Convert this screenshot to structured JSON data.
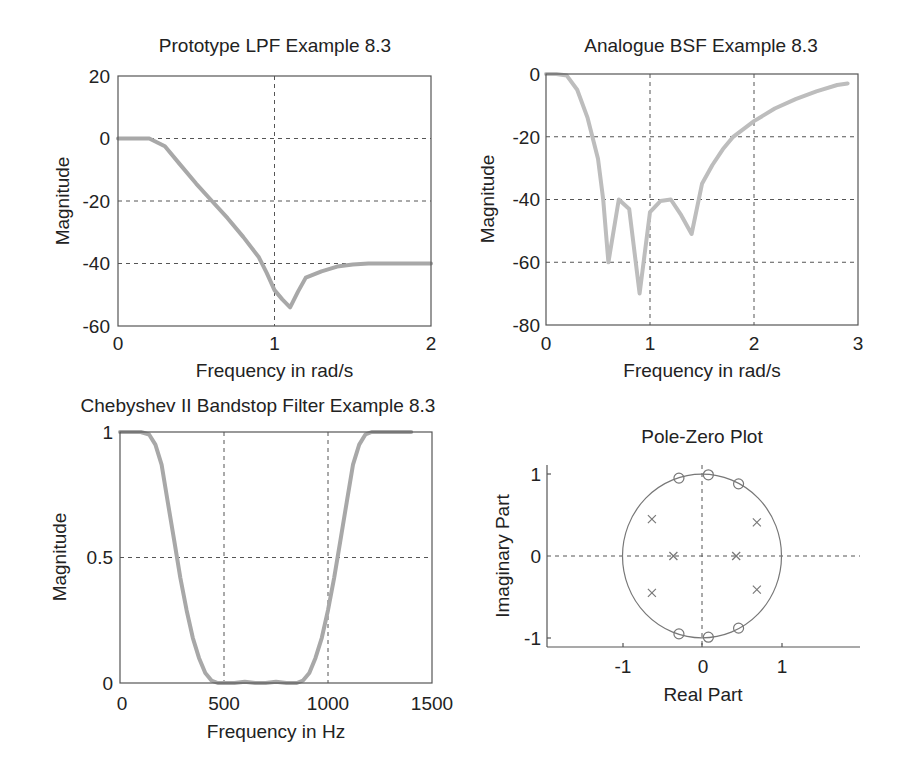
{
  "chart_data": [
    {
      "id": "lpf",
      "type": "line",
      "title": "Prototype LPF Example 8.3",
      "xlabel": "Frequency in rad/s",
      "ylabel": "Magnitude",
      "xlim": [
        0,
        2
      ],
      "ylim": [
        -60,
        20
      ],
      "xticks": [
        0,
        1,
        2
      ],
      "yticks": [
        20,
        0,
        -20,
        -40,
        -60
      ],
      "grid": true,
      "series": [
        {
          "name": "Magnitude (dB)",
          "x": [
            0,
            0.1,
            0.2,
            0.3,
            0.4,
            0.5,
            0.6,
            0.7,
            0.8,
            0.9,
            0.95,
            1.0,
            1.05,
            1.1,
            1.15,
            1.2,
            1.3,
            1.4,
            1.5,
            1.6,
            1.8,
            2.0
          ],
          "y": [
            0,
            0,
            0,
            -2.5,
            -8.5,
            -14.5,
            -20,
            -25.5,
            -31.5,
            -38,
            -43,
            -48.5,
            -51.5,
            -54,
            -49,
            -44.5,
            -42.5,
            -41,
            -40.3,
            -40,
            -40,
            -40
          ]
        }
      ]
    },
    {
      "id": "bsf",
      "type": "line",
      "title": "Analogue BSF Example 8.3",
      "xlabel": "Frequency in rad/s",
      "ylabel": "Magnitude",
      "xlim": [
        0,
        3
      ],
      "ylim": [
        -80,
        0
      ],
      "xticks": [
        0,
        1,
        2,
        3
      ],
      "yticks": [
        0,
        -20,
        -40,
        -60,
        -80
      ],
      "grid": true,
      "series": [
        {
          "name": "Magnitude (dB)",
          "x": [
            0,
            0.1,
            0.2,
            0.3,
            0.4,
            0.5,
            0.55,
            0.6,
            0.7,
            0.8,
            0.9,
            1.0,
            1.1,
            1.2,
            1.3,
            1.4,
            1.5,
            1.6,
            1.7,
            1.8,
            2.0,
            2.2,
            2.4,
            2.6,
            2.8,
            2.9
          ],
          "y": [
            0,
            0,
            -0.5,
            -5,
            -14,
            -27,
            -40,
            -60,
            -40,
            -43,
            -70,
            -44,
            -40.5,
            -40,
            -45,
            -51,
            -35,
            -29,
            -24,
            -20,
            -15,
            -11,
            -8,
            -5.5,
            -3.5,
            -3
          ]
        }
      ]
    },
    {
      "id": "cheby",
      "type": "line",
      "title": "Chebyshev II Bandstop Filter Example 8.3",
      "xlabel": "Frequency in Hz",
      "ylabel": "Magnitude",
      "xlim": [
        0,
        1500
      ],
      "ylim": [
        0,
        1
      ],
      "xticks": [
        0,
        500,
        1000,
        1500
      ],
      "yticks": [
        1,
        0.5,
        0
      ],
      "grid": true,
      "series": [
        {
          "name": "Magnitude (linear)",
          "x": [
            0,
            100,
            140,
            170,
            200,
            230,
            260,
            290,
            320,
            350,
            380,
            410,
            440,
            470,
            500,
            550,
            600,
            650,
            700,
            750,
            800,
            850,
            880,
            910,
            940,
            970,
            1000,
            1030,
            1060,
            1090,
            1120,
            1150,
            1180,
            1210,
            1240,
            1300,
            1400
          ],
          "y": [
            1,
            1,
            0.99,
            0.95,
            0.87,
            0.72,
            0.57,
            0.42,
            0.29,
            0.18,
            0.1,
            0.04,
            0.01,
            0.0,
            0.0,
            0.0,
            0.005,
            0.0,
            0.0,
            0.005,
            0.0,
            0.0,
            0.01,
            0.04,
            0.1,
            0.18,
            0.29,
            0.42,
            0.57,
            0.72,
            0.87,
            0.95,
            0.99,
            1,
            1,
            1,
            1
          ]
        }
      ]
    },
    {
      "id": "pz",
      "type": "scatter",
      "title": "Pole-Zero Plot",
      "xlabel": "Real Part",
      "ylabel": "Imaginary Part",
      "xlim": [
        -1.95,
        1.95
      ],
      "ylim": [
        -1.1,
        1.1
      ],
      "xticks": [
        -1,
        0,
        1
      ],
      "yticks": [
        1,
        0,
        -1
      ],
      "grid": false,
      "unit_circle": true,
      "zeros": [
        [
          -0.29,
          0.95
        ],
        [
          0.08,
          0.99
        ],
        [
          0.46,
          0.88
        ],
        [
          -0.29,
          -0.95
        ],
        [
          0.08,
          -0.99
        ],
        [
          0.46,
          -0.88
        ]
      ],
      "poles": [
        [
          -0.63,
          0.45
        ],
        [
          0.69,
          0.41
        ],
        [
          -0.36,
          0.0
        ],
        [
          0.43,
          0.0
        ],
        [
          -0.63,
          -0.45
        ],
        [
          0.69,
          -0.41
        ]
      ]
    }
  ]
}
